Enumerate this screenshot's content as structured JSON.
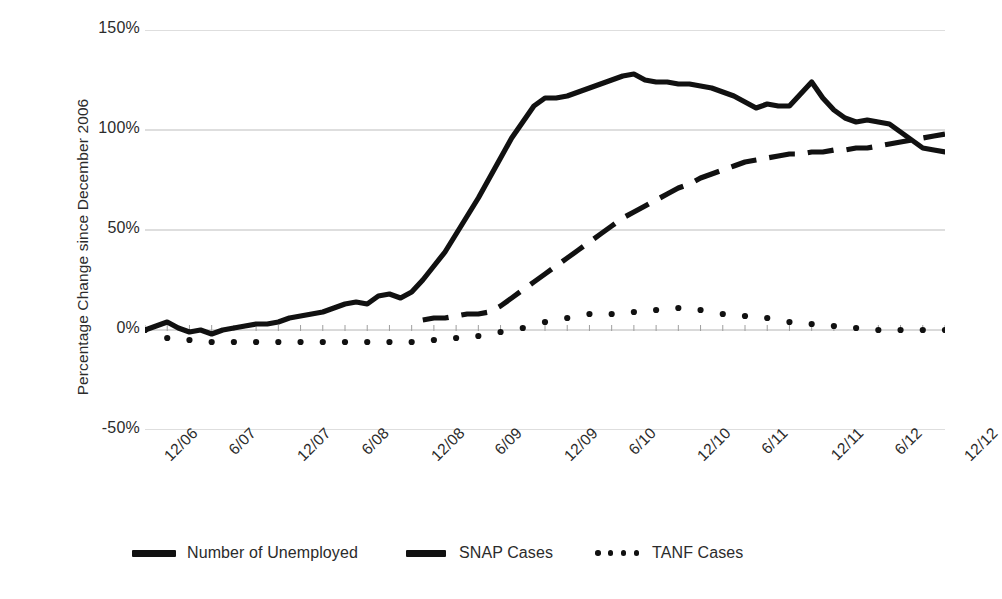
{
  "axes": {
    "ylabel": "Percentage Change since December 2006",
    "ytick_labels": [
      "150%",
      "100%",
      "50%",
      "0%",
      "-50%"
    ],
    "xtick_labels": [
      "12/06",
      "6/07",
      "12/07",
      "6/08",
      "12/08",
      "6/09",
      "12/09",
      "6/10",
      "12/10",
      "6/11",
      "12/11",
      "6/12",
      "12/12"
    ]
  },
  "legend": {
    "entries": [
      {
        "label": "Number of Unemployed",
        "marker": "solid-line-icon",
        "color": "#111111"
      },
      {
        "label": "SNAP Cases",
        "marker": "dashed-line-icon",
        "color": "#111111"
      },
      {
        "label": "TANF Cases",
        "marker": "dotted-line-icon",
        "color": "#111111"
      }
    ]
  },
  "chart_data": {
    "type": "line",
    "title": "",
    "subtitle": "",
    "xlabel": "",
    "ylabel": "Percentage Change since December 2006",
    "ylim": [
      -50,
      150
    ],
    "yticks": [
      -50,
      0,
      50,
      100,
      150
    ],
    "grid": true,
    "legend_position": "bottom",
    "x_tick_labels": [
      "12/06",
      "6/07",
      "12/07",
      "6/08",
      "12/08",
      "6/09",
      "12/09",
      "6/10",
      "12/10",
      "6/11",
      "12/11",
      "6/12",
      "12/12"
    ],
    "x_tick_indices": [
      0,
      6,
      12,
      18,
      24,
      30,
      36,
      42,
      48,
      54,
      60,
      66,
      72
    ],
    "x_unit": "month",
    "x_start": "12/06",
    "x_end": "12/12",
    "x_count": 73,
    "series": [
      {
        "name": "Number of Unemployed",
        "style": "solid",
        "color": "#111111",
        "values": [
          0,
          2,
          4,
          1,
          -1,
          0,
          -2,
          0,
          1,
          2,
          3,
          3,
          4,
          6,
          7,
          8,
          9,
          11,
          13,
          14,
          13,
          17,
          18,
          16,
          19,
          25,
          32,
          39,
          48,
          57,
          66,
          76,
          86,
          96,
          104,
          112,
          116,
          116,
          117,
          119,
          121,
          123,
          125,
          127,
          128,
          125,
          124,
          124,
          123,
          123,
          122,
          121,
          119,
          117,
          114,
          111,
          113,
          112,
          112,
          118,
          124,
          116,
          110,
          106,
          104,
          105,
          104,
          103,
          99,
          95,
          91,
          90,
          89
        ]
      },
      {
        "name": "SNAP Cases",
        "style": "dashed",
        "color": "#111111",
        "start_index": 25,
        "values": [
          null,
          null,
          null,
          null,
          null,
          null,
          null,
          null,
          null,
          null,
          null,
          null,
          null,
          null,
          null,
          null,
          null,
          null,
          null,
          null,
          null,
          null,
          null,
          null,
          null,
          5,
          6,
          6,
          7,
          8,
          8,
          9,
          12,
          16,
          20,
          24,
          28,
          32,
          36,
          40,
          44,
          48,
          52,
          56,
          59,
          62,
          65,
          68,
          71,
          73,
          76,
          78,
          80,
          82,
          84,
          85,
          86,
          87,
          88,
          88,
          89,
          89,
          90,
          90,
          91,
          91,
          92,
          93,
          94,
          95,
          96,
          97,
          98
        ]
      },
      {
        "name": "TANF Cases",
        "style": "dotted",
        "color": "#111111",
        "values": [
          0,
          -2,
          -4,
          -5,
          -5,
          -5,
          -6,
          -6,
          -6,
          -6,
          -6,
          -6,
          -6,
          -6,
          -6,
          -6,
          -6,
          -6,
          -6,
          -6,
          -6,
          -6,
          -6,
          -6,
          -6,
          -6,
          -5,
          -5,
          -4,
          -4,
          -3,
          -2,
          -1,
          0,
          1,
          2,
          4,
          5,
          6,
          7,
          8,
          8,
          8,
          9,
          9,
          10,
          10,
          11,
          11,
          10,
          10,
          9,
          8,
          8,
          7,
          6,
          6,
          5,
          4,
          4,
          3,
          2,
          2,
          1,
          1,
          1,
          0,
          0,
          0,
          0,
          0,
          0,
          0
        ]
      }
    ]
  }
}
